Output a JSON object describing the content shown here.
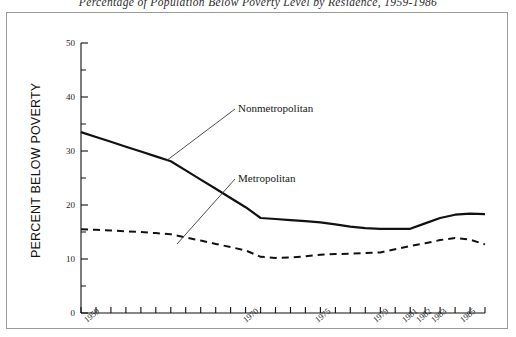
{
  "figure": {
    "title": "Percentage of Population Below Poverty Level by Residence, 1959-1986",
    "border_color": "#9a9a9a",
    "background": "#ffffff"
  },
  "axes": {
    "y_title": "PERCENT BELOW POVERTY",
    "y_ticks": [
      "0",
      "10",
      "20",
      "30",
      "40",
      "50"
    ],
    "x_ticks": [
      "1959",
      "1970",
      "1975",
      "1979",
      "1981",
      "1982",
      "1983",
      "1985"
    ],
    "line_color": "#111111"
  },
  "annotations": {
    "nonmetropolitan": "Nonmetropolitan",
    "metropolitan": "Metropolitan"
  },
  "chart_data": {
    "type": "line",
    "title": "Percentage of Population Below Poverty Level by Residence, 1959-1986",
    "xlabel": "",
    "ylabel": "PERCENT BELOW POVERTY",
    "xlim": [
      1959,
      1986
    ],
    "ylim": [
      0,
      50
    ],
    "yticks": [
      0,
      10,
      20,
      30,
      40,
      50
    ],
    "xticks": [
      1959,
      1970,
      1975,
      1979,
      1981,
      1982,
      1983,
      1985
    ],
    "grid": false,
    "legend": "inline-annotations",
    "x": [
      1959,
      1960,
      1961,
      1962,
      1963,
      1964,
      1965,
      1966,
      1967,
      1968,
      1969,
      1970,
      1971,
      1972,
      1973,
      1974,
      1975,
      1976,
      1977,
      1978,
      1979,
      1980,
      1981,
      1982,
      1983,
      1984,
      1985,
      1986
    ],
    "series": [
      {
        "name": "Nonmetropolitan",
        "style": "solid",
        "color": "#111111",
        "values": [
          33.5,
          32.6,
          31.7,
          30.8,
          29.9,
          29.0,
          28.1,
          26.4,
          24.7,
          23.0,
          21.3,
          19.6,
          17.6,
          17.4,
          17.2,
          17.0,
          16.8,
          16.4,
          16.0,
          15.7,
          15.6,
          15.6,
          15.6,
          16.6,
          17.6,
          18.2,
          18.4,
          18.3
        ]
      },
      {
        "name": "Metropolitan",
        "style": "dashed",
        "color": "#111111",
        "values": [
          15.5,
          15.4,
          15.3,
          15.1,
          15.0,
          14.8,
          14.6,
          14.0,
          13.4,
          12.8,
          12.2,
          11.6,
          10.4,
          10.2,
          10.3,
          10.5,
          10.8,
          10.9,
          11.0,
          11.1,
          11.2,
          11.8,
          12.4,
          12.9,
          13.5,
          13.9,
          13.6,
          12.7
        ]
      }
    ]
  }
}
